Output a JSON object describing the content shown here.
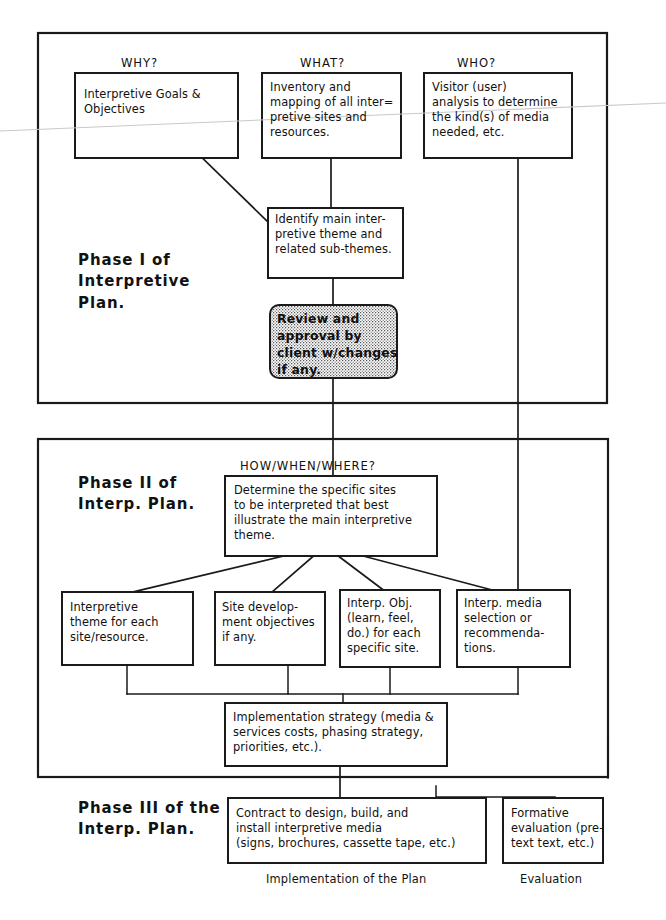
{
  "diagram": {
    "colors": {
      "ink": "#1a1a1a",
      "paper": "#ffffff",
      "scan_artifact": "#c9c9c9"
    },
    "phase_labels": {
      "phase1": "Phase I of\nInterpretive\nPlan.",
      "phase2": "Phase II of\nInterp. Plan.",
      "phase3": "Phase III of the\nInterp. Plan."
    },
    "column_headers": {
      "why": "WHY?",
      "what": "WHAT?",
      "who": "WHO?",
      "how_when_where": "HOW/WHEN/WHERE?"
    },
    "boxes": {
      "goals": "Interpretive Goals &\nObjectives",
      "inventory": "Inventory and\nmapping of all inter=\npretive sites and\nresources.",
      "visitor": "Visitor (user)\nanalysis to determine\nthe kind(s) of media\nneeded, etc.",
      "identify_theme": "Identify main inter-\npretive theme and\nrelated sub-themes.",
      "review_approval": "Review and\napproval by\nclient w/changes\nif any.",
      "determine_sites": "Determine the specific sites\nto be interpreted that best\nillustrate the main interpretive\ntheme.",
      "interp_theme_each_site": "Interpretive\ntheme for each\nsite/resource.",
      "site_development": "Site develop-\nment objectives\nif any.",
      "interp_obj": "Interp. Obj.\n(learn, feel,\ndo.) for each\nspecific site.",
      "interp_media": "Interp. media\nselection or\nrecommenda-\ntions.",
      "implementation_strategy": "Implementation strategy (media &\nservices costs, phasing strategy,\npriorities, etc.).",
      "contract": "Contract to design, build, and\ninstall interpretive media\n(signs, brochures, cassette tape, etc.)",
      "formative_evaluation": "Formative\nevaluation (pre-\ntext text, etc.)"
    },
    "captions": {
      "implementation": "Implementation of the Plan",
      "evaluation": "Evaluation"
    }
  }
}
